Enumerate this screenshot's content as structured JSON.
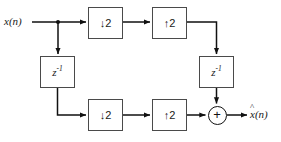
{
  "diagram": {
    "type": "block-diagram",
    "background_color": "#ffffff",
    "line_color": "#111111",
    "box_border_color": "#4a4a4a",
    "text_color": "#1a1a1a",
    "signals": {
      "input_label": "x(n)",
      "output_label_base": "x",
      "output_label_hat": "^",
      "output_label_suffix": "(n)",
      "output_label_full": "x̂(n)"
    },
    "blocks": [
      {
        "id": "down-top",
        "label": "↓2",
        "kind": "downsampler",
        "factor": 2,
        "row": "top",
        "x": 88,
        "y": 7,
        "w": 35,
        "h": 32
      },
      {
        "id": "up-top",
        "label": "↑2",
        "kind": "upsampler",
        "factor": 2,
        "row": "top",
        "x": 152,
        "y": 7,
        "w": 35,
        "h": 32
      },
      {
        "id": "delay-left",
        "label": "z",
        "exponent": "-1",
        "kind": "unit-delay",
        "row": "middle-left",
        "x": 40,
        "y": 56,
        "w": 35,
        "h": 32
      },
      {
        "id": "delay-right",
        "label": "z",
        "exponent": "-1",
        "kind": "unit-delay",
        "row": "middle-right",
        "x": 199,
        "y": 56,
        "w": 35,
        "h": 32
      },
      {
        "id": "down-bottom",
        "label": "↓2",
        "kind": "downsampler",
        "factor": 2,
        "row": "bottom",
        "x": 88,
        "y": 99,
        "w": 35,
        "h": 32
      },
      {
        "id": "up-bottom",
        "label": "↑2",
        "kind": "upsampler",
        "factor": 2,
        "row": "bottom",
        "x": 152,
        "y": 99,
        "w": 35,
        "h": 32
      }
    ],
    "adder": {
      "id": "summing-junction",
      "symbol": "+",
      "cx": 217,
      "cy": 115,
      "r": 9.5
    },
    "branch_node": {
      "id": "input-branch-node",
      "x": 58,
      "y": 22
    },
    "connections": [
      {
        "from": "input",
        "to": "input-branch-node"
      },
      {
        "from": "input-branch-node",
        "to": "down-top"
      },
      {
        "from": "input-branch-node",
        "to": "delay-left"
      },
      {
        "from": "down-top",
        "to": "up-top"
      },
      {
        "from": "up-top",
        "to": "delay-right"
      },
      {
        "from": "delay-left",
        "to": "down-bottom"
      },
      {
        "from": "down-bottom",
        "to": "up-bottom"
      },
      {
        "from": "up-bottom",
        "to": "summing-junction"
      },
      {
        "from": "delay-right",
        "to": "summing-junction"
      },
      {
        "from": "summing-junction",
        "to": "output"
      }
    ]
  }
}
